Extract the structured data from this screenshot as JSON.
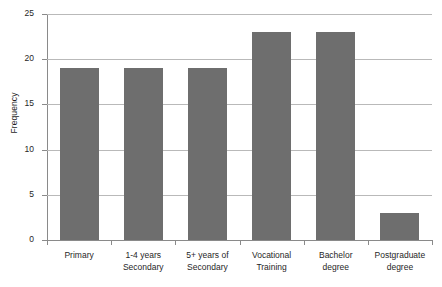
{
  "chart_data": {
    "type": "bar",
    "title": "",
    "xlabel": "",
    "ylabel": "Frequency",
    "ylim": [
      0,
      25
    ],
    "yticks": [
      0,
      5,
      10,
      15,
      20,
      25
    ],
    "ytick_labels": [
      "0",
      "5",
      "10",
      "15",
      "20",
      "25"
    ],
    "grid": true,
    "legend": "none",
    "bar_color": "#6e6e6e",
    "categories": [
      "Primary",
      "1-4 years Secondary",
      "5+ years of Secondary",
      "Vocational Training",
      "Bachelor degree",
      "Postgraduate degree"
    ],
    "category_lines": [
      [
        "Primary",
        ""
      ],
      [
        "1-4 years",
        "Secondary"
      ],
      [
        "5+ years of",
        "Secondary"
      ],
      [
        "Vocational",
        "Training"
      ],
      [
        "Bachelor",
        "degree"
      ],
      [
        "Postgraduate",
        "degree"
      ]
    ],
    "values": [
      19,
      19,
      19,
      23,
      23,
      3
    ]
  }
}
